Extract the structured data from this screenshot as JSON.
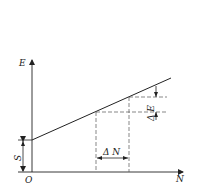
{
  "diagram": {
    "axes": {
      "x_label": "N",
      "y_label": "E",
      "origin_label": "O"
    },
    "annotations": {
      "intercept_label": "S",
      "delta_n_label": "Δ N",
      "delta_e_label": "Δ E"
    },
    "line": {
      "description": "E increases linearly with N starting from intercept S",
      "start": {
        "N": 0,
        "E": "S"
      },
      "slope_label": "ΔE/ΔN"
    },
    "colors": {
      "line": "#222222",
      "dashed": "#555555",
      "background": "#ffffff"
    }
  }
}
